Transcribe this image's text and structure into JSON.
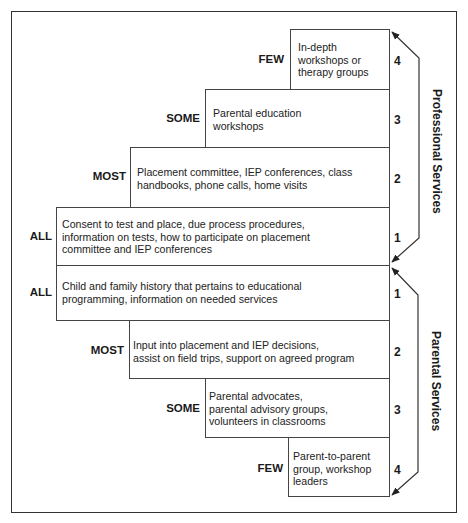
{
  "diagram": {
    "sections": [
      {
        "name": "Professional Services",
        "tiers": [
          {
            "number": "4",
            "level": "FEW",
            "text": "In-depth\nworkshops or\ntherapy groups"
          },
          {
            "number": "3",
            "level": "SOME",
            "text": "Parental education\nworkshops"
          },
          {
            "number": "2",
            "level": "MOST",
            "text": "Placement committee, IEP conferences, class\nhandbooks, phone calls, home visits"
          },
          {
            "number": "1",
            "level": "ALL",
            "text": "Consent to test and place, due process procedures,\ninformation on tests, how to participate on placement\ncommittee and IEP conferences"
          }
        ]
      },
      {
        "name": "Parental Services",
        "tiers": [
          {
            "number": "1",
            "level": "ALL",
            "text": "Child and family history that pertains to educational\nprogramming, information on needed services"
          },
          {
            "number": "2",
            "level": "MOST",
            "text": "Input into placement and IEP decisions,\nassist on field trips, support on agreed program"
          },
          {
            "number": "3",
            "level": "SOME",
            "text": "Parental advocates,\nparental advisory groups,\nvolunteers in classrooms"
          },
          {
            "number": "4",
            "level": "FEW",
            "text": "Parent-to-parent\ngroup, workshop\nleaders"
          }
        ]
      }
    ]
  }
}
